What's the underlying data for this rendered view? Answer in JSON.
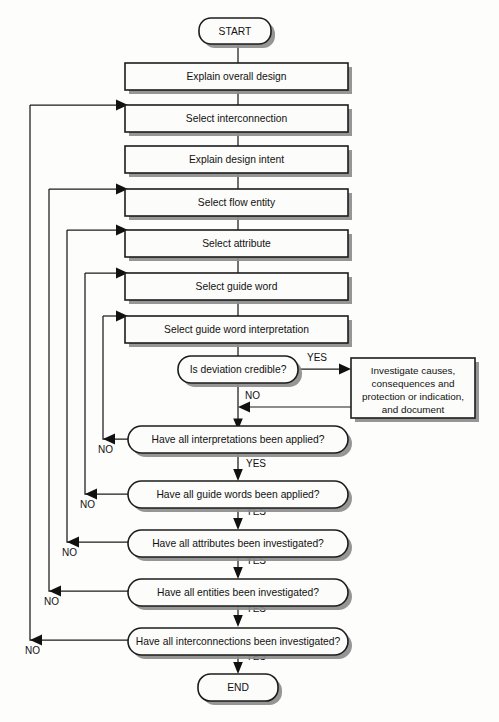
{
  "diagram": {
    "background_color": "#fdfdfc",
    "line_color": "#1c1c1c",
    "node_fill": "#fcfcfa",
    "shadow_color": "#8d8d8d"
  },
  "nodes": {
    "start": {
      "label": "START",
      "shape": "stadium"
    },
    "explain_overall_design": {
      "label": "Explain overall design",
      "shape": "rect"
    },
    "select_interconnection": {
      "label": "Select interconnection",
      "shape": "rect"
    },
    "explain_design_intent": {
      "label": "Explain design intent",
      "shape": "rect"
    },
    "select_flow_entity": {
      "label": "Select flow entity",
      "shape": "rect"
    },
    "select_attribute": {
      "label": "Select attribute",
      "shape": "rect"
    },
    "select_guide_word": {
      "label": "Select guide word",
      "shape": "rect"
    },
    "select_guide_word_interpretation": {
      "label": "Select guide word interpretation",
      "shape": "rect"
    },
    "is_deviation_credible": {
      "label": "Is deviation credible?",
      "shape": "stadium"
    },
    "investigate": {
      "shape": "rect",
      "lines": [
        "Investigate causes,",
        "consequences and",
        "protection or indication,",
        "and document"
      ]
    },
    "all_interpretations": {
      "label": "Have all interpretations been applied?",
      "shape": "stadium"
    },
    "all_guide_words": {
      "label": "Have all guide words been applied?",
      "shape": "stadium"
    },
    "all_attributes": {
      "label": "Have all attributes been investigated?",
      "shape": "stadium"
    },
    "all_entities": {
      "label": "Have all entities been investigated?",
      "shape": "stadium"
    },
    "all_interconnections": {
      "label": "Have all interconnections been investigated?",
      "shape": "stadium"
    },
    "end": {
      "label": "END",
      "shape": "stadium"
    }
  },
  "edge_labels": {
    "yes_deviation": "YES",
    "no_deviation": "NO",
    "no_interpretations": "NO",
    "yes_interpretations": "YES",
    "no_guide_words": "NO",
    "yes_guide_words": "YES",
    "no_attributes": "NO",
    "yes_attributes": "YES",
    "no_entities": "NO",
    "yes_entities": "YES",
    "no_interconnections": "NO",
    "yes_interconnections": "YES"
  }
}
